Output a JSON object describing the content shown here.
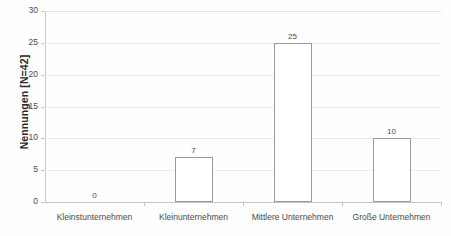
{
  "chart_data": {
    "type": "bar",
    "title": "",
    "xlabel": "",
    "ylabel": "Nennungen [N=42]",
    "categories": [
      "Kleinstunternehmen",
      "Kleinunternehmen",
      "Mittlere Unternehmen",
      "Große Unternehmen"
    ],
    "values": [
      0,
      7,
      25,
      10
    ],
    "value_labels": [
      "0",
      "7",
      "25",
      "10"
    ],
    "ylim": [
      0,
      30
    ],
    "yticks": [
      0,
      5,
      10,
      15,
      20,
      25,
      30
    ],
    "ytick_labels": [
      "0",
      "5",
      "10",
      "15",
      "20",
      "25",
      "30"
    ],
    "grid": true,
    "legend": "none",
    "bar_fill": "#ffffff",
    "bar_border": "#9a9a9a",
    "gridline_color": "#ededed",
    "axis_color": "#c4c4c4",
    "background": "#fefefe"
  }
}
